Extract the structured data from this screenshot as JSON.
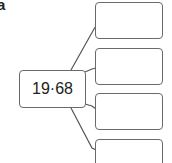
{
  "part_label": "a",
  "center_node": {
    "value": "19·68"
  },
  "answer_boxes": [
    {
      "value": ""
    },
    {
      "value": ""
    },
    {
      "value": ""
    },
    {
      "value": ""
    }
  ],
  "colors": {
    "stroke": "#555555",
    "text": "#222222"
  }
}
